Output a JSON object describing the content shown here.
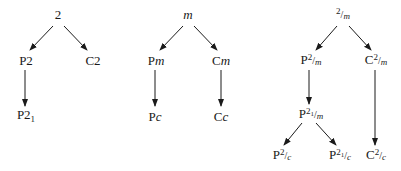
{
  "diagram": {
    "title": "",
    "trees": [
      {
        "root": {
          "id": "2",
          "label": "2"
        },
        "nodes": [
          {
            "id": "P2",
            "prefix": "P",
            "main": "2",
            "sub": "",
            "italic": ""
          },
          {
            "id": "C2",
            "prefix": "C",
            "main": "2",
            "sub": "",
            "italic": ""
          },
          {
            "id": "P21",
            "prefix": "P",
            "main": "2",
            "sub": "1",
            "italic": ""
          }
        ],
        "edges": [
          [
            "2",
            "P2"
          ],
          [
            "2",
            "C2"
          ],
          [
            "P2",
            "P21"
          ]
        ]
      },
      {
        "root": {
          "id": "m",
          "label": "m"
        },
        "nodes": [
          {
            "id": "Pm",
            "prefix": "P",
            "italic": "m"
          },
          {
            "id": "Cm",
            "prefix": "C",
            "italic": "m"
          },
          {
            "id": "Pc",
            "prefix": "P",
            "italic": "c"
          },
          {
            "id": "Cc",
            "prefix": "C",
            "italic": "c"
          }
        ],
        "edges": [
          [
            "m",
            "Pm"
          ],
          [
            "m",
            "Cm"
          ],
          [
            "Pm",
            "Pc"
          ],
          [
            "Cm",
            "Cc"
          ]
        ]
      },
      {
        "root": {
          "id": "2/m",
          "num": "2",
          "den": "m"
        },
        "nodes": [
          {
            "id": "P2/m",
            "prefix": "P",
            "num": "2",
            "den": "m"
          },
          {
            "id": "C2/m",
            "prefix": "C",
            "num": "2",
            "den": "m"
          },
          {
            "id": "P21/m",
            "prefix": "P",
            "num": "2",
            "numsub": "1",
            "den": "m"
          },
          {
            "id": "P2/c",
            "prefix": "P",
            "num": "2",
            "den": "c"
          },
          {
            "id": "P21/c",
            "prefix": "P",
            "num": "2",
            "numsub": "1",
            "den": "c"
          },
          {
            "id": "C2/c",
            "prefix": "C",
            "num": "2",
            "den": "c"
          }
        ],
        "edges": [
          [
            "2/m",
            "P2/m"
          ],
          [
            "2/m",
            "C2/m"
          ],
          [
            "P2/m",
            "P21/m"
          ],
          [
            "P21/m",
            "P2/c"
          ],
          [
            "P21/m",
            "P21/c"
          ],
          [
            "C2/m",
            "C2/c"
          ]
        ]
      }
    ],
    "colors": {
      "line": "#1a1a1a",
      "text": "#1a1a1a",
      "background": "#ffffff"
    }
  }
}
